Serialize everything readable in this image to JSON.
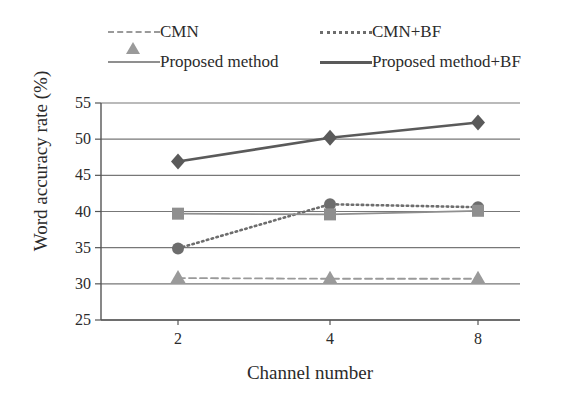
{
  "chart_data": {
    "type": "line",
    "title": "",
    "xlabel": "Channel number",
    "ylabel": "Word accuracy rate (%)",
    "x": [
      2,
      4,
      8
    ],
    "categories": [
      "2",
      "4",
      "8"
    ],
    "xtick_labels": [
      "2",
      "4",
      "8"
    ],
    "ytick_labels": [
      "25",
      "30",
      "35",
      "40",
      "45",
      "50",
      "55"
    ],
    "ylim": [
      25,
      55
    ],
    "ytick_step": 5,
    "grid": true,
    "legend_position": "top",
    "series": [
      {
        "name": "CMN",
        "values": [
          30.8,
          30.7,
          30.7
        ],
        "marker": "triangle",
        "line_style": "dashed",
        "color": "#9a9a9a"
      },
      {
        "name": "CMN+BF",
        "values": [
          34.9,
          41.0,
          40.6
        ],
        "marker": "circle",
        "line_style": "dotted",
        "color": "#6d6d6d"
      },
      {
        "name": "Proposed method",
        "values": [
          39.7,
          39.6,
          40.1
        ],
        "marker": "square",
        "line_style": "solid",
        "color": "#8f8f8f"
      },
      {
        "name": "Proposed method+BF",
        "values": [
          46.9,
          50.2,
          52.3
        ],
        "marker": "diamond",
        "line_style": "solid",
        "color": "#5a5a5a"
      }
    ]
  },
  "legend": {
    "items": [
      {
        "label": "CMN",
        "marker": "triangle-marker",
        "color": "#9a9a9a",
        "line_style": "dashed"
      },
      {
        "label": "CMN+BF",
        "marker": "circle-marker",
        "color": "#6d6d6d",
        "line_style": "dotted"
      },
      {
        "label": "Proposed method",
        "marker": "square-marker",
        "color": "#8f8f8f",
        "line_style": "solid"
      },
      {
        "label": "Proposed method+BF",
        "marker": "diamond-marker",
        "color": "#5a5a5a",
        "line_style": "solid"
      }
    ]
  },
  "axes": {
    "x_title": "Channel number",
    "y_title": "Word accuracy rate (%)",
    "y_ticks": [
      "55",
      "50",
      "45",
      "40",
      "35",
      "30",
      "25"
    ],
    "x_ticks": [
      "2",
      "4",
      "8"
    ]
  },
  "colors": {
    "axis": "#555555",
    "grid": "#777777",
    "background": "#ffffff",
    "text": "#2b2b2b"
  }
}
